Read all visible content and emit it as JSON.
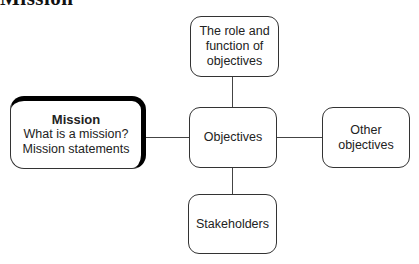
{
  "heading": {
    "text": "Mission"
  },
  "diagram": {
    "center": {
      "label": "Objectives"
    },
    "top": {
      "lines": [
        "The role and",
        "function of",
        "objectives"
      ]
    },
    "left": {
      "title": "Mission",
      "lines": [
        "What is a mission?",
        "Mission statements"
      ]
    },
    "right": {
      "lines": [
        "Other",
        "objectives"
      ]
    },
    "bottom": {
      "label": "Stakeholders"
    }
  }
}
